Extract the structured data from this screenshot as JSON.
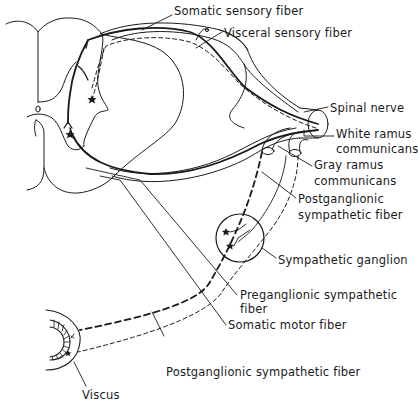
{
  "diagram": {
    "colors": {
      "line": "#1a1a1a",
      "background": "#ffffff"
    },
    "labels": {
      "somatic_sensory_fiber": "Somatic sensory fiber",
      "visceral_sensory_fiber": "Visceral sensory fiber",
      "spinal_nerve": "Spinal nerve",
      "white_ramus_1": "White ramus",
      "white_ramus_2": "communicans",
      "gray_ramus_1": "Gray ramus",
      "gray_ramus_2": "communicans",
      "postganglionic_right_1": "Postganglionic",
      "postganglionic_right_2": "sympathetic fiber",
      "sympathetic_ganglion": "Sympathetic ganglion",
      "preganglionic_1": "Preganglionic sympathetic",
      "preganglionic_2": "fiber",
      "somatic_motor_fiber": "Somatic motor fiber",
      "postganglionic_bottom": "Postganglionic sympathetic fiber",
      "viscus": "Viscus"
    }
  }
}
